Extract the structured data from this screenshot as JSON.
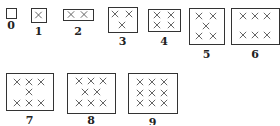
{
  "figure": {
    "items": [
      {
        "label": "0",
        "count": 0,
        "box": [
          6,
          8,
          10,
          10
        ],
        "label_y": 29,
        "marks": []
      },
      {
        "label": "1",
        "count": 1,
        "box": [
          31,
          8,
          15,
          14
        ],
        "label_y": 35,
        "marks": [
          [
            38.5,
            15
          ]
        ]
      },
      {
        "label": "2",
        "count": 2,
        "box": [
          63,
          9,
          30,
          11
        ],
        "label_y": 35,
        "marks": [
          [
            71,
            14.5
          ],
          [
            84,
            14.5
          ]
        ]
      },
      {
        "label": "3",
        "count": 3,
        "box": [
          108,
          7,
          29,
          25
        ],
        "label_y": 45,
        "marks": [
          [
            115,
            14
          ],
          [
            129,
            14
          ],
          [
            122,
            25
          ]
        ]
      },
      {
        "label": "4",
        "count": 4,
        "box": [
          148,
          9,
          32,
          22
        ],
        "label_y": 45,
        "marks": [
          [
            157,
            15
          ],
          [
            171,
            15
          ],
          [
            157,
            25
          ],
          [
            171,
            25
          ]
        ]
      },
      {
        "label": "5",
        "count": 5,
        "box": [
          189,
          8,
          35,
          36
        ],
        "label_y": 58,
        "marks": [
          [
            199,
            16
          ],
          [
            213,
            16
          ],
          [
            206,
            26
          ],
          [
            199,
            36
          ],
          [
            213,
            36
          ]
        ]
      },
      {
        "label": "6",
        "count": 6,
        "box": [
          231,
          8,
          48,
          36
        ],
        "label_y": 58,
        "marks": [
          [
            243,
            16
          ],
          [
            255,
            16
          ],
          [
            267,
            16
          ],
          [
            243,
            35
          ],
          [
            255,
            35
          ],
          [
            267,
            35
          ]
        ]
      },
      {
        "label": "7",
        "count": 7,
        "box": [
          6,
          73,
          47,
          37
        ],
        "label_y": 124,
        "marks": [
          [
            17,
            82
          ],
          [
            29,
            82
          ],
          [
            41,
            82
          ],
          [
            29,
            92
          ],
          [
            17,
            103
          ],
          [
            29,
            103
          ],
          [
            41,
            103
          ]
        ]
      },
      {
        "label": "8",
        "count": 8,
        "box": [
          67,
          73,
          48,
          40
        ],
        "label_y": 124,
        "marks": [
          [
            79,
            81
          ],
          [
            91,
            81
          ],
          [
            103,
            81
          ],
          [
            85,
            92
          ],
          [
            97,
            92
          ],
          [
            79,
            103
          ],
          [
            91,
            103
          ],
          [
            103,
            103
          ]
        ]
      },
      {
        "label": "9",
        "count": 9,
        "box": [
          128,
          73,
          49,
          40
        ],
        "label_y": 126,
        "marks": [
          [
            140,
            82
          ],
          [
            152,
            82
          ],
          [
            164,
            82
          ],
          [
            140,
            93
          ],
          [
            152,
            93
          ],
          [
            164,
            93
          ],
          [
            140,
            103
          ],
          [
            152,
            103
          ],
          [
            164,
            103
          ]
        ]
      }
    ]
  }
}
